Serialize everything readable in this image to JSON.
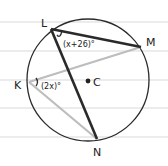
{
  "diagram": {
    "center_label": "C",
    "points": [
      {
        "id": "L",
        "label": "L"
      },
      {
        "id": "M",
        "label": "M"
      },
      {
        "id": "K",
        "label": "K"
      },
      {
        "id": "N",
        "label": "N"
      }
    ],
    "chords": [
      {
        "from": "L",
        "to": "M",
        "style": "dark"
      },
      {
        "from": "L",
        "to": "N",
        "style": "dark"
      },
      {
        "from": "K",
        "to": "M",
        "style": "light"
      },
      {
        "from": "K",
        "to": "N",
        "style": "light"
      }
    ],
    "angles": [
      {
        "vertex": "L",
        "label": "(x+26)°"
      },
      {
        "vertex": "K",
        "label": "(2x)°"
      }
    ],
    "colors": {
      "dark_chord": "#2a2a2a",
      "light_chord": "#bdbdbd",
      "circle": "#2a2a2a",
      "ruled_line": "#d9d9d9"
    }
  }
}
